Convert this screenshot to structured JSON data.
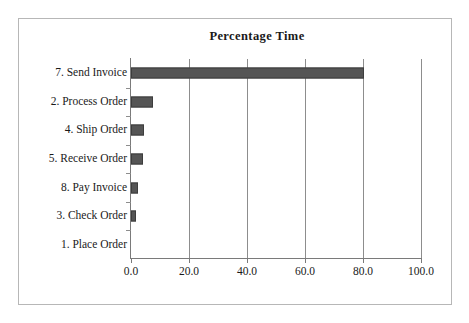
{
  "figure": {
    "title": "Percentage Time",
    "background_color": "#ffffff",
    "border_color": "#b7b7b7",
    "bar_color": "#555555",
    "grid_color": "#8d8d8d",
    "axis_color": "#7a7a7a"
  },
  "chart_data": {
    "type": "bar",
    "orientation": "horizontal",
    "title": "Percentage Time",
    "xlabel": "",
    "ylabel": "",
    "categories": [
      "7. Send Invoice",
      "2. Process Order",
      "4. Ship Order",
      "5. Receive Order",
      "8. Pay Invoice",
      "3. Check Order",
      "1. Place Order"
    ],
    "values": [
      80.5,
      7.5,
      4.5,
      4.3,
      2.4,
      1.7,
      0.0
    ],
    "xlim": [
      0.0,
      100.0
    ],
    "xticks": [
      0.0,
      20.0,
      40.0,
      60.0,
      80.0,
      100.0
    ],
    "xticklabels": [
      "0.0",
      "20.0",
      "40.0",
      "60.0",
      "80.0",
      "100.0"
    ],
    "grid": "vertical",
    "legend": null
  }
}
